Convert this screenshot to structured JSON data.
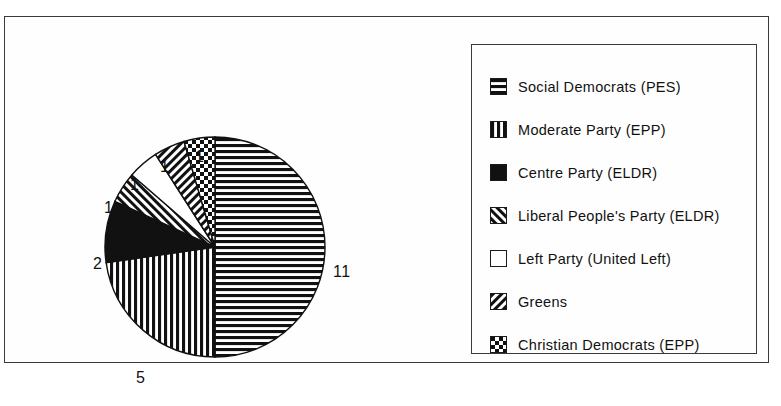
{
  "figure": {
    "frame": true,
    "background_color": "#ffffff",
    "line_color": "#3a3a3a"
  },
  "chart_data": {
    "type": "pie",
    "title": "",
    "total": 22,
    "value_unit": "seats",
    "legend_position": "right",
    "start_angle_deg": 90,
    "direction": "clockwise",
    "categories": [
      "Social Democrats (PES)",
      "Moderate Party (EPP)",
      "Centre Party (ELDR)",
      "Liberal People's Party (ELDR)",
      "Left Party (United Left)",
      "Greens",
      "Christian Democrats (EPP)"
    ],
    "values": [
      11,
      5,
      2,
      1,
      1,
      1,
      1
    ],
    "labels": [
      "11",
      "5",
      "2",
      "1",
      "1",
      "1",
      "1"
    ],
    "patterns": [
      "horizontal-stripes",
      "vertical-stripes",
      "solid-black",
      "backslash-diagonal",
      "white-empty",
      "forward-diagonal",
      "checkerboard"
    ],
    "slices": [
      {
        "name": "Social Democrats (PES)",
        "value": 11,
        "label": "11",
        "pattern": "horizontal-stripes",
        "label_x": 328,
        "label_y": 246
      },
      {
        "name": "Moderate Party (EPP)",
        "value": 5,
        "label": "5",
        "pattern": "vertical-stripes",
        "label_x": 131,
        "label_y": 352
      },
      {
        "name": "Centre Party (ELDR)",
        "value": 2,
        "label": "2",
        "pattern": "solid-black",
        "label_x": 88,
        "label_y": 238
      },
      {
        "name": "Liberal People's Party (ELDR)",
        "value": 1,
        "label": "1",
        "pattern": "backslash-diagonal",
        "label_x": 99,
        "label_y": 182
      },
      {
        "name": "Left Party (United Left)",
        "value": 1,
        "label": "1",
        "pattern": "white-empty",
        "label_x": 125,
        "label_y": 159
      },
      {
        "name": "Greens",
        "value": 1,
        "label": "1",
        "pattern": "forward-diagonal",
        "label_x": 155,
        "label_y": 141
      },
      {
        "name": "Christian Democrats (EPP)",
        "value": 1,
        "label": "1",
        "pattern": "checkerboard",
        "label_x": 190,
        "label_y": 131
      }
    ]
  },
  "legend": {
    "items": [
      {
        "label": "Social Democrats (PES)",
        "pattern": "horizontal-stripes"
      },
      {
        "label": "Moderate Party (EPP)",
        "pattern": "vertical-stripes"
      },
      {
        "label": "Centre Party (ELDR)",
        "pattern": "solid-black"
      },
      {
        "label": "Liberal People's Party (ELDR)",
        "pattern": "backslash-diagonal"
      },
      {
        "label": "Left Party (United Left)",
        "pattern": "white-empty"
      },
      {
        "label": "Greens",
        "pattern": "forward-diagonal"
      },
      {
        "label": "Christian Democrats (EPP)",
        "pattern": "checkerboard"
      }
    ]
  }
}
